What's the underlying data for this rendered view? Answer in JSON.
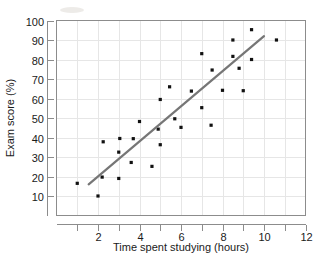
{
  "chart_data": {
    "type": "scatter",
    "title": "",
    "xlabel": "Time spent studying (hours)",
    "ylabel": "Exam score (%)",
    "xlim": [
      0,
      12
    ],
    "ylim": [
      0,
      100
    ],
    "xticks": [
      2,
      4,
      6,
      8,
      10,
      12
    ],
    "xticks_minor": [
      1,
      3,
      5,
      7,
      9,
      11
    ],
    "yticks": [
      10,
      20,
      30,
      40,
      50,
      60,
      70,
      80,
      90,
      100
    ],
    "grid": true,
    "legend": "none",
    "marker_color": "#111111",
    "trendline_color": "#767676",
    "grid_color": "#e6e6e6",
    "frame_color": "#8c8c8c",
    "points": [
      {
        "x": 1.0,
        "y": 16.5
      },
      {
        "x": 2.0,
        "y": 10.0
      },
      {
        "x": 2.2,
        "y": 19.7
      },
      {
        "x": 2.25,
        "y": 37.8
      },
      {
        "x": 3.0,
        "y": 19.0
      },
      {
        "x": 3.0,
        "y": 32.5
      },
      {
        "x": 3.05,
        "y": 39.5
      },
      {
        "x": 3.6,
        "y": 27.2
      },
      {
        "x": 3.7,
        "y": 39.4
      },
      {
        "x": 4.0,
        "y": 48.2
      },
      {
        "x": 4.6,
        "y": 25.2
      },
      {
        "x": 4.9,
        "y": 44.3
      },
      {
        "x": 5.0,
        "y": 36.3
      },
      {
        "x": 5.0,
        "y": 59.5
      },
      {
        "x": 5.45,
        "y": 66.0
      },
      {
        "x": 5.7,
        "y": 49.6
      },
      {
        "x": 6.0,
        "y": 45.2
      },
      {
        "x": 6.5,
        "y": 63.8
      },
      {
        "x": 7.0,
        "y": 55.3
      },
      {
        "x": 7.0,
        "y": 83.0
      },
      {
        "x": 7.45,
        "y": 46.3
      },
      {
        "x": 7.5,
        "y": 74.6
      },
      {
        "x": 8.0,
        "y": 64.2
      },
      {
        "x": 8.5,
        "y": 81.6
      },
      {
        "x": 8.5,
        "y": 90.0
      },
      {
        "x": 8.8,
        "y": 75.5
      },
      {
        "x": 9.0,
        "y": 64.0
      },
      {
        "x": 9.4,
        "y": 80.0
      },
      {
        "x": 9.4,
        "y": 95.3
      },
      {
        "x": 10.6,
        "y": 90.0
      }
    ],
    "trendline": {
      "x1": 1.55,
      "y1": 16.0,
      "x2": 10.0,
      "y2": 92.0
    }
  }
}
